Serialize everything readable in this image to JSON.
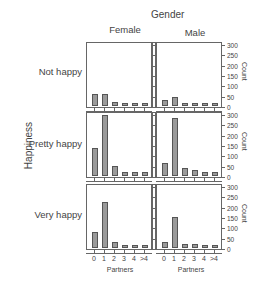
{
  "chart_data": {
    "type": "bar",
    "title": "Gender",
    "column_facet_label": "Gender",
    "row_facet_label": "Happiness",
    "columns": [
      "Female",
      "Male"
    ],
    "rows": [
      "Not happy",
      "Pretty happy",
      "Very happy"
    ],
    "categories": [
      "0",
      "1",
      "2",
      "3",
      "4",
      ">4"
    ],
    "xlabel": "Partners",
    "ylabel": "Count",
    "ylim": [
      0,
      300
    ],
    "yticks": [
      0,
      50,
      100,
      150,
      200,
      250,
      300
    ],
    "panels": [
      {
        "row": "Not happy",
        "column": "Female",
        "values": [
          60,
          60,
          20,
          15,
          15,
          15
        ]
      },
      {
        "row": "Not happy",
        "column": "Male",
        "values": [
          30,
          45,
          15,
          15,
          15,
          15
        ]
      },
      {
        "row": "Pretty happy",
        "column": "Female",
        "values": [
          135,
          295,
          50,
          20,
          20,
          20
        ]
      },
      {
        "row": "Pretty happy",
        "column": "Male",
        "values": [
          65,
          280,
          40,
          30,
          20,
          20
        ]
      },
      {
        "row": "Very happy",
        "column": "Female",
        "values": [
          75,
          222,
          28,
          15,
          15,
          15
        ]
      },
      {
        "row": "Very happy",
        "column": "Male",
        "values": [
          30,
          150,
          18,
          18,
          15,
          15
        ]
      }
    ],
    "grid": false,
    "legend": null
  },
  "labels": {
    "gender": "Gender",
    "female": "Female",
    "male": "Male",
    "happiness": "Happiness",
    "not_happy": "Not happy",
    "pretty_happy": "Pretty happy",
    "very_happy": "Very happy",
    "partners": "Partners",
    "count": "Count"
  },
  "colors": {
    "bar_fill": "#9a9a9a",
    "bar_stroke": "#555555",
    "axis": "#666666",
    "text": "#444444"
  }
}
